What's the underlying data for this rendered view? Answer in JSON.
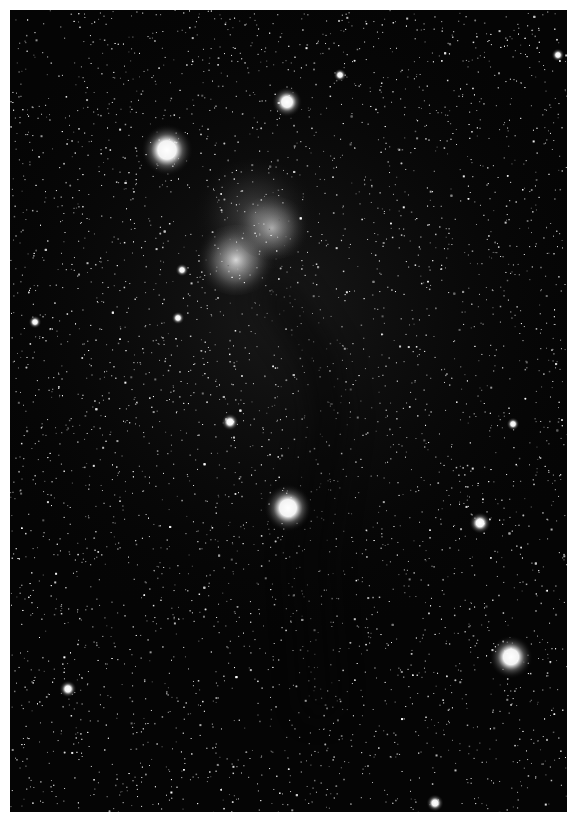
{
  "image": {
    "subject": "star field with reflection nebula and dark nebula lane",
    "border_color": "#ffffff",
    "background_color": "#050505",
    "frame": {
      "x": 10,
      "y": 10,
      "width": 557,
      "height": 802
    }
  },
  "bright_stars": [
    {
      "x": 287,
      "y": 102,
      "r": 7
    },
    {
      "x": 167,
      "y": 150,
      "r": 12
    },
    {
      "x": 340,
      "y": 75,
      "r": 3
    },
    {
      "x": 558,
      "y": 55,
      "r": 3
    },
    {
      "x": 288,
      "y": 508,
      "r": 11
    },
    {
      "x": 480,
      "y": 523,
      "r": 5
    },
    {
      "x": 511,
      "y": 657,
      "r": 10
    },
    {
      "x": 68,
      "y": 689,
      "r": 4
    },
    {
      "x": 435,
      "y": 803,
      "r": 4
    },
    {
      "x": 230,
      "y": 422,
      "r": 4
    },
    {
      "x": 513,
      "y": 424,
      "r": 3
    },
    {
      "x": 35,
      "y": 322,
      "r": 3
    },
    {
      "x": 178,
      "y": 318,
      "r": 3
    },
    {
      "x": 182,
      "y": 270,
      "r": 3
    }
  ],
  "nebulae": [
    {
      "x": 236,
      "y": 260,
      "rx": 26,
      "ry": 22,
      "brightness": 0.95
    },
    {
      "x": 272,
      "y": 228,
      "rx": 24,
      "ry": 20,
      "brightness": 0.7
    },
    {
      "x": 255,
      "y": 215,
      "rx": 40,
      "ry": 35,
      "brightness": 0.25
    }
  ],
  "dark_lane": [
    {
      "x": 280,
      "y": 300
    },
    {
      "x": 320,
      "y": 360
    },
    {
      "x": 330,
      "y": 420
    },
    {
      "x": 310,
      "y": 560
    },
    {
      "x": 320,
      "y": 700
    }
  ],
  "faint_star_count": 5200
}
